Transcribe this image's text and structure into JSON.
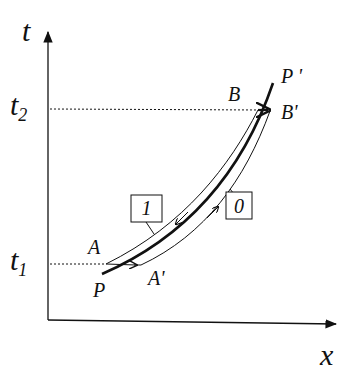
{
  "figure": {
    "axes": {
      "y_label": "t",
      "x_label": "x"
    },
    "ticks": {
      "t2": {
        "base": "t",
        "sub": "2"
      },
      "t1": {
        "base": "t",
        "sub": "1"
      }
    },
    "points": {
      "P": "P",
      "P_prime": "P '",
      "A": "A",
      "A_prime": "A'",
      "B": "B",
      "B_prime": "B'"
    },
    "boxes": {
      "box1": "1",
      "box0": "0"
    },
    "colors": {
      "stroke": "#111111",
      "background": "#ffffff"
    }
  }
}
